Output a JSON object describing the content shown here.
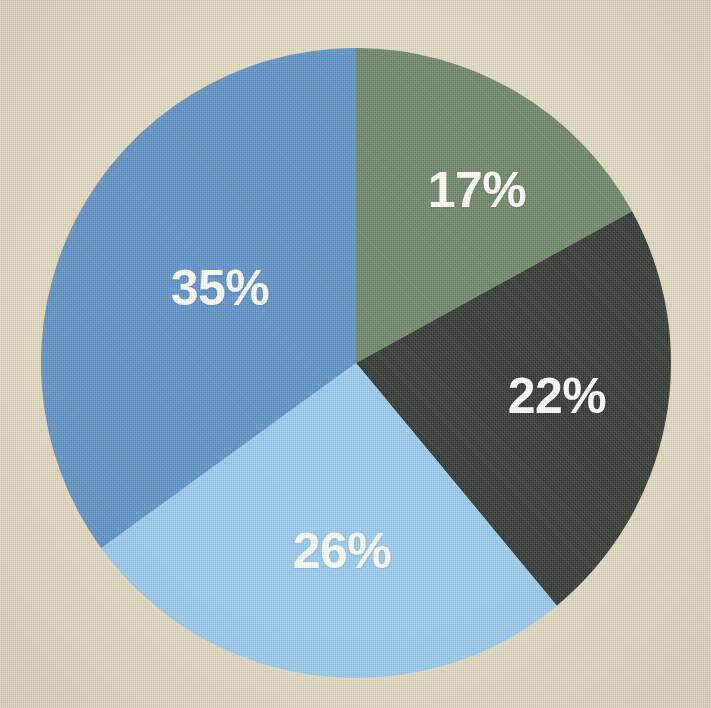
{
  "background_color": "#ddd5bb",
  "label_color": "#fdfcf6",
  "chart_data": {
    "type": "pie",
    "title": "",
    "subtitle": "",
    "xlabel": "",
    "ylabel": "",
    "legend": "none",
    "grid": false,
    "start_angle_deg": 0,
    "direction": "clockwise",
    "center": {
      "x": 356,
      "y": 363
    },
    "radius": 315,
    "units": "percent",
    "total": 100,
    "categories": [
      "17%",
      "22%",
      "26%",
      "35%"
    ],
    "values": [
      17,
      22,
      26,
      35
    ],
    "colors": [
      "#5e7a5a",
      "#1e2420",
      "#8ec5ee",
      "#4d88c4"
    ],
    "slices": [
      {
        "label": "17%",
        "value": 17,
        "color": "#5e7a5a",
        "start_deg": 0,
        "end_deg": 61.2,
        "label_x": 477,
        "label_y": 190
      },
      {
        "label": "22%",
        "value": 22,
        "color": "#1e2420",
        "start_deg": 61.2,
        "end_deg": 140.4,
        "label_x": 557,
        "label_y": 396
      },
      {
        "label": "26%",
        "value": 26,
        "color": "#8ec5ee",
        "start_deg": 140.4,
        "end_deg": 234.0,
        "label_x": 342,
        "label_y": 551
      },
      {
        "label": "35%",
        "value": 35,
        "color": "#4d88c4",
        "start_deg": 234.0,
        "end_deg": 360.0,
        "label_x": 220,
        "label_y": 288
      }
    ]
  }
}
